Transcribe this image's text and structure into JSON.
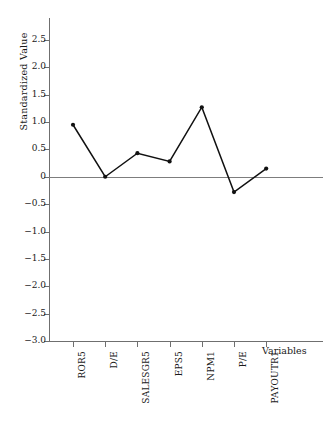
{
  "chart_data": {
    "type": "line",
    "title": "",
    "xlabel": "Variables",
    "ylabel": "Standardized Value",
    "categories": [
      "ROR5",
      "D/E",
      "SALESGR5",
      "EPS5",
      "NPM1",
      "P/E",
      "PAYOUTR1"
    ],
    "values": [
      0.95,
      0.0,
      0.43,
      0.28,
      1.27,
      -0.28,
      0.15
    ],
    "series": [
      {
        "name": "Standardized Value",
        "values": [
          0.95,
          0.0,
          0.43,
          0.28,
          1.27,
          -0.28,
          0.15
        ]
      }
    ],
    "ylim": [
      -3.0,
      2.9
    ],
    "ytick_values": [
      2.5,
      2.0,
      1.5,
      1.0,
      0.5,
      0.0,
      -0.5,
      -1.0,
      -1.5,
      -2.0,
      -2.5,
      -3.0
    ],
    "ytick_labels": [
      "2.5",
      "2.0",
      "1.5",
      "1.0",
      "0.5",
      "0",
      "−0.5",
      "−1.0",
      "−1.5",
      "−2.0",
      "−2.5",
      "−3.0"
    ],
    "grid": false,
    "legend": false,
    "legend_position": "none",
    "marker": "filled-circle",
    "line_color": "#111111",
    "zero_line_color": "#7d7d7d",
    "axis_color": "#6f6f6f"
  },
  "caption": {
    "text": ""
  }
}
